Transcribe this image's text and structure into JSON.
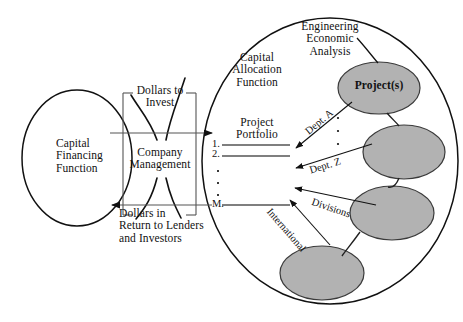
{
  "figure": {
    "type": "diagram",
    "background": "#ffffff",
    "ink": "#111111",
    "ellipse_fill": "#b2b2b2",
    "ellipse_stroke": "#3a3a3a"
  },
  "left_circle": {
    "label_line1": "Capital",
    "label_line2": "Financing",
    "label_line3": "Function"
  },
  "center_box": {
    "top_label_line1": "Dollars to",
    "top_label_line2": "Invest",
    "body_line1": "Company",
    "body_line2": "Management",
    "bottom_label_line1": "Dollars in",
    "bottom_label_line2": "Return to Lenders",
    "bottom_label_line3": "and Investors"
  },
  "right_ellipse": {
    "function_line1": "Capital",
    "function_line2": "Allocation",
    "function_line3": "Function",
    "portfolio_line1": "Project",
    "portfolio_line2": "Portfolio",
    "analysis_line1": "Engineering",
    "analysis_line2": "Economic",
    "analysis_line3": "Analysis",
    "projects_label": "Project(s)"
  },
  "portfolio_items": [
    {
      "marker": "1."
    },
    {
      "marker": "2."
    },
    {
      "marker": "M."
    }
  ],
  "flow_labels": [
    {
      "id": "dept-a",
      "text": "Dept. A"
    },
    {
      "id": "dept-z",
      "text": "Dept. Z"
    },
    {
      "id": "divisions",
      "text": "Divisions"
    },
    {
      "id": "international",
      "text": "International"
    }
  ],
  "project_nodes": [
    {
      "index": 1,
      "label": "Project(s)",
      "filled": true
    },
    {
      "index": 2,
      "label": "",
      "filled": true
    },
    {
      "index": 3,
      "label": "",
      "filled": true
    },
    {
      "index": 4,
      "label": "",
      "filled": true
    }
  ]
}
